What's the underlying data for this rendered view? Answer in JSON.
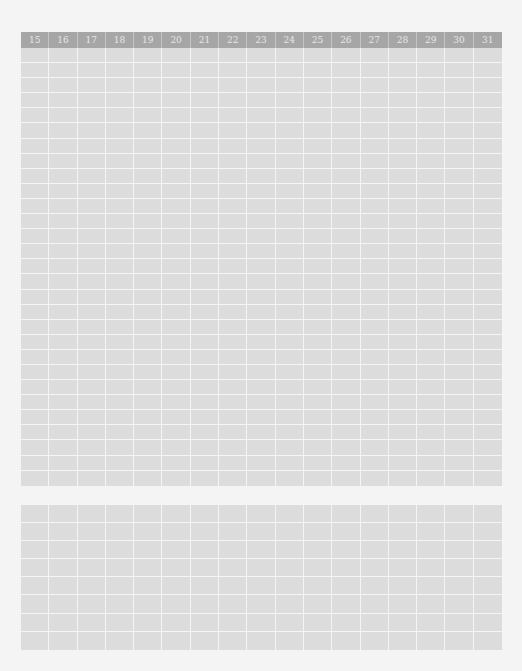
{
  "page": {
    "background": "#f4f4f4",
    "header_color": "#a6a6a6",
    "cell_color": "#dcdcdc",
    "line_color": "#f4f4f4"
  },
  "top_grid": {
    "columns": [
      "15",
      "16",
      "17",
      "18",
      "19",
      "20",
      "21",
      "22",
      "23",
      "24",
      "25",
      "26",
      "27",
      "28",
      "29",
      "30",
      "31"
    ],
    "rows": 29
  },
  "bottom_grid": {
    "columns_count": 17,
    "rows": 8
  }
}
